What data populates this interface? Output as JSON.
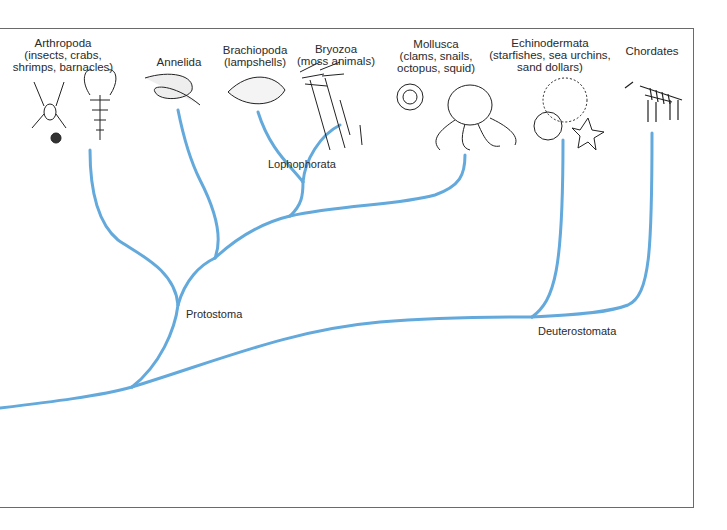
{
  "diagram": {
    "type": "phylogenetic-tree",
    "line_color": "#63a9dc",
    "frame_color": "#6a6a6a",
    "taxa": [
      {
        "id": "arthropoda",
        "name": "Arthropoda",
        "common": "(insects, crabs,",
        "common2": "shrimps, barnacles)",
        "illustration": "spider, ladybug, lobster"
      },
      {
        "id": "annelida",
        "name": "Annelida",
        "common": "",
        "common2": "",
        "illustration": "segmented worm"
      },
      {
        "id": "brachiopoda",
        "name": "Brachiopoda",
        "common": "(lampshells)",
        "common2": "",
        "illustration": "lampshell"
      },
      {
        "id": "bryozoa",
        "name": "Bryozoa",
        "common": "(moss animals)",
        "common2": "",
        "illustration": "moss animal colony"
      },
      {
        "id": "mollusca",
        "name": "Mollusca",
        "common": "(clams, snails,",
        "common2": "octopus, squid)",
        "illustration": "snail and octopus"
      },
      {
        "id": "echinodermata",
        "name": "Echinodermata",
        "common": "(starfishes, sea urchins,",
        "common2": "sand dollars)",
        "illustration": "sea urchin, sand dollar, starfish"
      },
      {
        "id": "chordates",
        "name": "Chordates",
        "common": "",
        "common2": "",
        "illustration": "zebra"
      }
    ],
    "clades": {
      "lophophorata": "Lophophorata",
      "protostoma": "Protostoma",
      "deuterostomata": "Deuterostomata"
    }
  }
}
